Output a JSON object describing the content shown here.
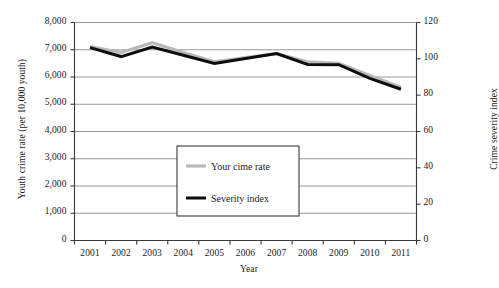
{
  "chart_data": {
    "type": "line",
    "title": "",
    "xlabel": "Year",
    "ylabel": "Youth crime rate (per 10,000 youth)",
    "ylabel_right": "Crime severity index",
    "categories": [
      "2001",
      "2002",
      "2003",
      "2004",
      "2005",
      "2006",
      "2007",
      "2008",
      "2009",
      "2010",
      "2011"
    ],
    "x": [
      2001,
      2002,
      2003,
      2004,
      2005,
      2006,
      2007,
      2008,
      2009,
      2010,
      2011
    ],
    "ylim": [
      0,
      8000
    ],
    "ylim_right": [
      0,
      120
    ],
    "yticks": [
      "0",
      "1,000",
      "2,000",
      "3,000",
      "4,000",
      "5,000",
      "6,000",
      "7,000",
      "8,000"
    ],
    "ytick_values": [
      0,
      1000,
      2000,
      3000,
      4000,
      5000,
      6000,
      7000,
      8000
    ],
    "yticks_right": [
      "0",
      "20",
      "40",
      "60",
      "80",
      "100",
      "120"
    ],
    "ytick_values_right": [
      0,
      20,
      40,
      60,
      80,
      100,
      120
    ],
    "grid": true,
    "grid_axis": "y",
    "legend_position": "center",
    "series": [
      {
        "name": "Your cime rate",
        "axis": "left",
        "color": "#b9b9b9",
        "width": 3.2,
        "values": [
          7120,
          6900,
          7260,
          6900,
          6560,
          6710,
          6860,
          6560,
          6500,
          6060,
          5620
        ]
      },
      {
        "name": "Severity index",
        "axis": "left",
        "color": "#0d0d0d",
        "width": 3.0,
        "values": [
          7080,
          6750,
          7100,
          6800,
          6500,
          6680,
          6860,
          6460,
          6450,
          5950,
          5550
        ]
      }
    ]
  },
  "legend": {
    "items": [
      {
        "label": "Your cime rate",
        "color": "#b9b9b9"
      },
      {
        "label": "Severity index",
        "color": "#0d0d0d"
      }
    ]
  },
  "colors": {
    "axis": "#3a3a3a",
    "grid": "#8c8c8c",
    "background": "#ffffff",
    "text": "#1a1a1a",
    "series_gray": "#b9b9b9",
    "series_black": "#0d0d0d"
  }
}
